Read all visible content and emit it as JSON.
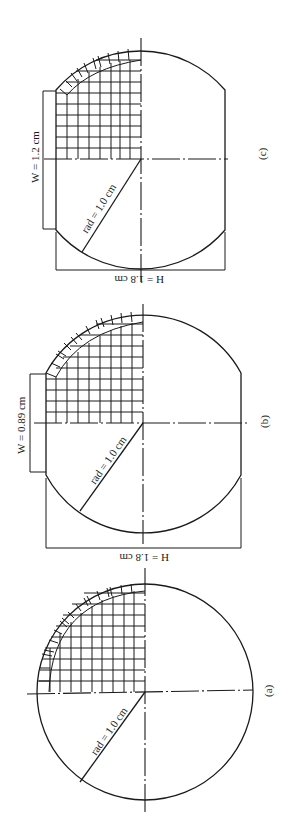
{
  "figures": [
    {
      "id": "c",
      "caption": "(c)",
      "radius_label": "rad = 1.0 cm",
      "width_label": "W = 1.2 cm",
      "height_label": "H = 1.6 cm"
    },
    {
      "id": "b",
      "caption": "(b)",
      "radius_label": "rad = 1.0 cm",
      "width_label": "W = 0.89 cm",
      "height_label": "H = 1.8 cm"
    },
    {
      "id": "a",
      "caption": "(a)",
      "radius_label": "rad = 1.0 cm"
    }
  ],
  "colors": {
    "line": "#1a1a1a",
    "background": "#ffffff"
  }
}
